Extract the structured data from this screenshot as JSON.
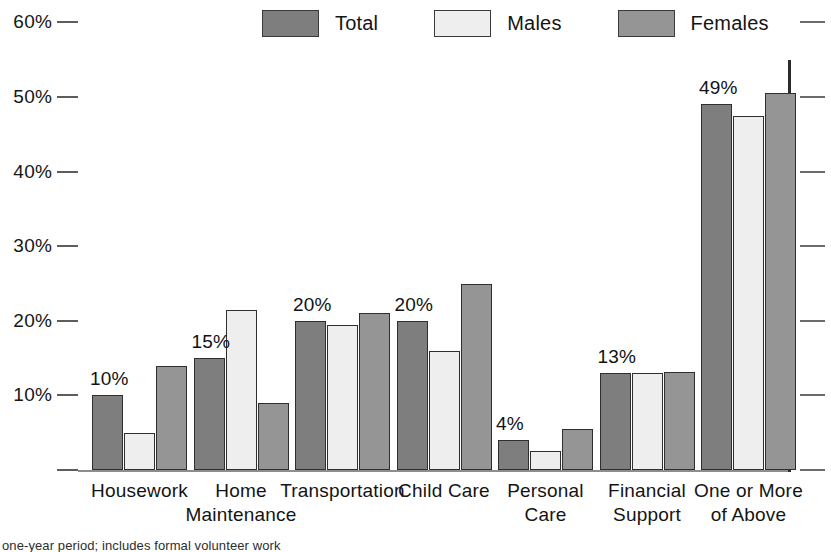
{
  "legend": {
    "items": [
      {
        "label": "Total",
        "color": "#7e7e7e",
        "name": "legend-total"
      },
      {
        "label": "Males",
        "color": "#eeeeee",
        "name": "legend-males"
      },
      {
        "label": "Females",
        "color": "#959595",
        "name": "legend-females"
      }
    ]
  },
  "footnote": {
    "text": "one-year period; includes formal volunteer work"
  },
  "chart_data": {
    "type": "bar",
    "title": "",
    "subtitle": "",
    "xlabel": "",
    "ylabel": "",
    "ylim": [
      0,
      60
    ],
    "ytick_values": [
      60,
      50,
      40,
      30,
      20,
      10,
      0
    ],
    "ytick_labels": [
      "60%",
      "50%",
      "40%",
      "30%",
      "20%",
      "10%",
      ""
    ],
    "grid": false,
    "legend_position": "top-center",
    "value_labels_series": "Total",
    "categories": [
      "Housework",
      "Home Maintenance",
      "Transportation",
      "Child Care",
      "Personal Care",
      "Financial Support",
      "One or More of Above"
    ],
    "category_lines": [
      [
        "Housework"
      ],
      [
        "Home",
        "Maintenance"
      ],
      [
        "Transportation"
      ],
      [
        "Child Care"
      ],
      [
        "Personal",
        "Care"
      ],
      [
        "Financial",
        "Support"
      ],
      [
        "One or More",
        "of Above"
      ]
    ],
    "series": [
      {
        "name": "Total",
        "color": "#7e7e7e",
        "values": [
          10,
          15,
          20,
          20,
          4,
          13,
          49
        ]
      },
      {
        "name": "Males",
        "color": "#eeeeee",
        "values": [
          5,
          21.5,
          19.5,
          16,
          2.5,
          13,
          47.5
        ]
      },
      {
        "name": "Females",
        "color": "#959595",
        "values": [
          14,
          9,
          21,
          25,
          5.5,
          13.2,
          50.5
        ]
      }
    ],
    "data_labels": [
      "10%",
      "15%",
      "20%",
      "20%",
      "4%",
      "13%",
      "49%"
    ]
  }
}
